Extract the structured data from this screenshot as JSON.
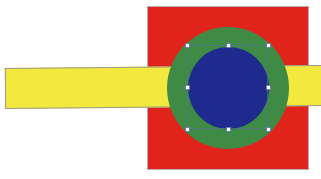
{
  "canvas": {
    "background": "#ffffff",
    "width": 321,
    "height": 179
  },
  "shapes": [
    {
      "name": "red-square",
      "type": "rectangle",
      "color": "#e0231b",
      "layer": 1
    },
    {
      "name": "yellow-bar",
      "type": "rectangle",
      "color": "#f3e83e",
      "layer": 2
    },
    {
      "name": "green-circle",
      "type": "ellipse",
      "color": "#3f8a45",
      "layer": 3
    },
    {
      "name": "blue-circle",
      "type": "ellipse",
      "color": "#1e2a8e",
      "layer": 4,
      "selected": true
    }
  ],
  "selection": {
    "target": "blue-circle",
    "handle_color": "#ffffff",
    "handle_outline": "#6a7fae",
    "handles": [
      {
        "pos": "top-left",
        "x": 187,
        "y": 45
      },
      {
        "pos": "top-center",
        "x": 228,
        "y": 45
      },
      {
        "pos": "top-right",
        "x": 268,
        "y": 45
      },
      {
        "pos": "middle-left",
        "x": 187,
        "y": 87
      },
      {
        "pos": "middle-right",
        "x": 268,
        "y": 87
      },
      {
        "pos": "bottom-left",
        "x": 187,
        "y": 129
      },
      {
        "pos": "bottom-center",
        "x": 228,
        "y": 129
      },
      {
        "pos": "bottom-right",
        "x": 268,
        "y": 129
      }
    ]
  }
}
